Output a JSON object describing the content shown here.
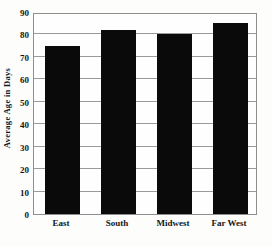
{
  "chart_data": {
    "type": "bar",
    "title": "",
    "xlabel": "",
    "ylabel": "Average Age in Days",
    "categories": [
      "East",
      "South",
      "Midwest",
      "Far West"
    ],
    "values": [
      75,
      82,
      80,
      85
    ],
    "ylim": [
      0,
      90
    ],
    "ytick_step": 10,
    "yticks": [
      0,
      10,
      20,
      30,
      40,
      50,
      60,
      70,
      80,
      90
    ],
    "ytick_labels": [
      "0",
      "10",
      "20",
      "30",
      "40",
      "50",
      "60",
      "70",
      "80",
      "90"
    ],
    "grid": "horizontal",
    "legend": "none",
    "bar_color": "#0a0a0a",
    "frame_color": "#8e8e8e",
    "gridline_color": "#9a9a9a",
    "background_color": "#fdfdfb"
  }
}
